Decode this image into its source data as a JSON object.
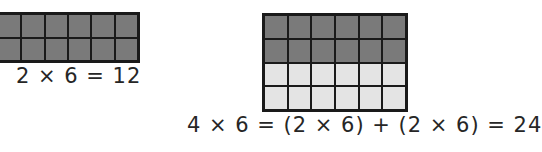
{
  "left_model": {
    "rows": 2,
    "columns": 6,
    "row_shading": [
      "dark",
      "dark"
    ],
    "equation": "2 × 6 = 12"
  },
  "right_model": {
    "rows": 4,
    "columns": 6,
    "row_shading": [
      "dark",
      "dark",
      "light",
      "light"
    ],
    "equation": "4 × 6 = (2 × 6) + (2 × 6) = 24"
  },
  "colors": {
    "dark_fill": "#7a7a7a",
    "light_fill": "#e4e4e4",
    "grid_line": "#1a1a1a"
  }
}
